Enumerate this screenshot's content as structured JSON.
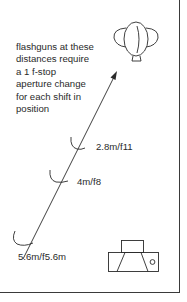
{
  "diagram": {
    "caption_lines": [
      "flashguns at these",
      "distances require",
      "a 1 f-stop",
      "aperture change",
      "for each shift in",
      "position"
    ],
    "positions": [
      {
        "label": "2.8m/f11",
        "distance": "2.8m",
        "aperture": "f11"
      },
      {
        "label": "4m/f8",
        "distance": "4m",
        "aperture": "f8"
      },
      {
        "label": "5.6m/f5.6m",
        "distance": "5.6m",
        "aperture": "f5.6"
      }
    ],
    "icons": {
      "subject": "flashgun-subject-icon",
      "camera": "camera-icon"
    },
    "colors": {
      "line": "#2a2a2a",
      "background": "#ffffff"
    }
  }
}
